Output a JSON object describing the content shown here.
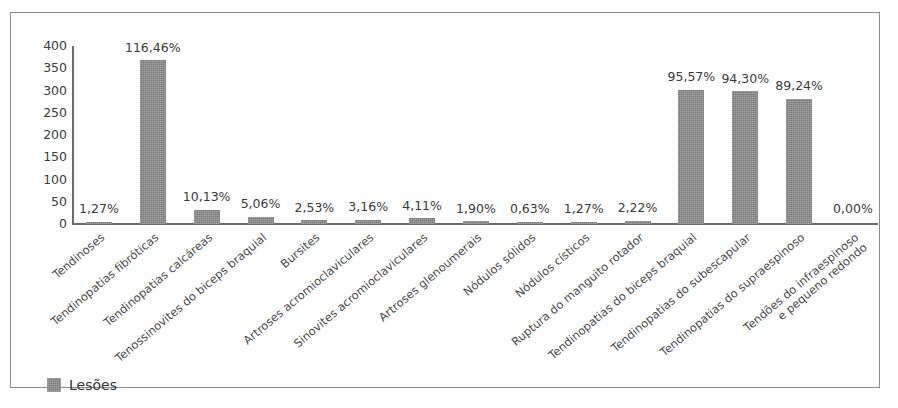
{
  "chart_data": {
    "type": "bar",
    "title": "",
    "xlabel": "",
    "ylabel": "",
    "ylim": [
      0,
      400
    ],
    "yticks": [
      400,
      350,
      300,
      250,
      200,
      150,
      100,
      50,
      0
    ],
    "grid": false,
    "legend": {
      "position": "bottom-left",
      "entries": [
        {
          "name": "Lesões",
          "color": "#7b7b7b"
        }
      ]
    },
    "series_name": "Lesões",
    "bar_color": "#7b7b7b",
    "categories": [
      "Tendinoses",
      "Tendinopatias fibróticas",
      "Tendinopatias calcáreas",
      "Tenossinovites do biceps braquial",
      "Bursites",
      "Artroses acromioclaviculares",
      "Sinovites acromioclaviculares",
      "Artroses glenoumerais",
      "Nódulos sólidos",
      "Nódulos císticos",
      "Ruptura do manguito rotador",
      "Tendinopatias do biceps braquial",
      "Tendinopatias do subescapular",
      "Tendinopatias do supraespinoso",
      "Tendões do infraespinoso e pequeno redondo"
    ],
    "values": [
      4,
      368,
      32,
      16,
      8,
      10,
      13,
      6,
      2,
      4,
      7,
      302,
      298,
      282,
      0
    ],
    "data_labels": [
      "1,27%",
      "116,46%",
      "10,13%",
      "5,06%",
      "2,53%",
      "3,16%",
      "4,11%",
      "1,90%",
      "0,63%",
      "1,27%",
      "2,22%",
      "95,57%",
      "94,30%",
      "89,24%",
      "0,00%"
    ]
  }
}
